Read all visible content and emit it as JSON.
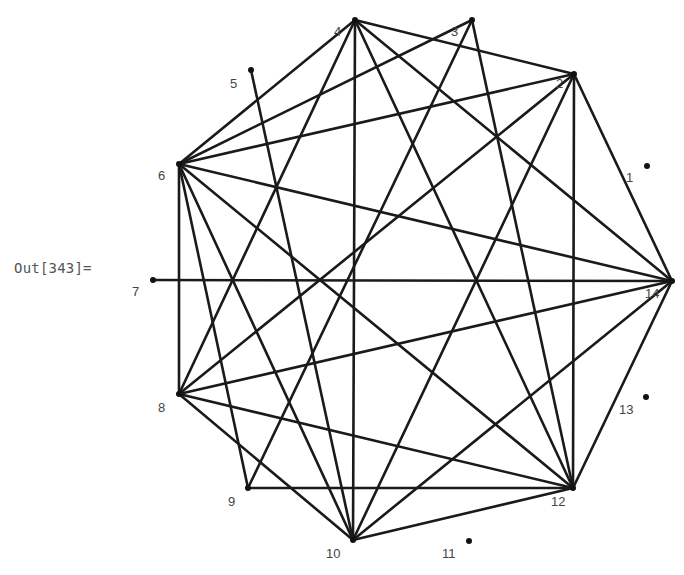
{
  "cell": {
    "output_label": "Out[343]="
  },
  "graph": {
    "vertices": [
      {
        "id": "1",
        "x": 647,
        "y": 166,
        "lx": 626,
        "ly": 182
      },
      {
        "id": "2",
        "x": 574,
        "y": 74,
        "lx": 556,
        "ly": 88
      },
      {
        "id": "3",
        "x": 472,
        "y": 20,
        "lx": 451,
        "ly": 36
      },
      {
        "id": "4",
        "x": 355,
        "y": 20,
        "lx": 334,
        "ly": 36
      },
      {
        "id": "5",
        "x": 251,
        "y": 70,
        "lx": 230,
        "ly": 88
      },
      {
        "id": "6",
        "x": 179,
        "y": 164,
        "lx": 158,
        "ly": 180
      },
      {
        "id": "7",
        "x": 153,
        "y": 280,
        "lx": 132,
        "ly": 296
      },
      {
        "id": "8",
        "x": 179,
        "y": 394,
        "lx": 158,
        "ly": 412
      },
      {
        "id": "9",
        "x": 248,
        "y": 488,
        "lx": 228,
        "ly": 506
      },
      {
        "id": "10",
        "x": 353,
        "y": 540,
        "lx": 326,
        "ly": 558
      },
      {
        "id": "11",
        "x": 469,
        "y": 541,
        "lx": 442,
        "ly": 558
      },
      {
        "id": "12",
        "x": 573,
        "y": 488,
        "lx": 551,
        "ly": 506
      },
      {
        "id": "13",
        "x": 646,
        "y": 397,
        "lx": 619,
        "ly": 414
      },
      {
        "id": "14",
        "x": 672,
        "y": 281,
        "lx": 645,
        "ly": 298
      }
    ],
    "edges": [
      [
        "2",
        "4"
      ],
      [
        "2",
        "6"
      ],
      [
        "2",
        "8"
      ],
      [
        "2",
        "10"
      ],
      [
        "2",
        "12"
      ],
      [
        "2",
        "14"
      ],
      [
        "3",
        "6"
      ],
      [
        "3",
        "9"
      ],
      [
        "3",
        "12"
      ],
      [
        "4",
        "6"
      ],
      [
        "4",
        "8"
      ],
      [
        "4",
        "10"
      ],
      [
        "4",
        "12"
      ],
      [
        "4",
        "14"
      ],
      [
        "5",
        "10"
      ],
      [
        "6",
        "8"
      ],
      [
        "6",
        "9"
      ],
      [
        "6",
        "10"
      ],
      [
        "6",
        "12"
      ],
      [
        "6",
        "14"
      ],
      [
        "7",
        "14"
      ],
      [
        "8",
        "10"
      ],
      [
        "8",
        "12"
      ],
      [
        "8",
        "14"
      ],
      [
        "9",
        "12"
      ],
      [
        "10",
        "12"
      ],
      [
        "10",
        "14"
      ],
      [
        "12",
        "14"
      ]
    ],
    "colors": {
      "edge": "#1a1a1a",
      "vertex": "#111111",
      "label": "#444444"
    }
  }
}
